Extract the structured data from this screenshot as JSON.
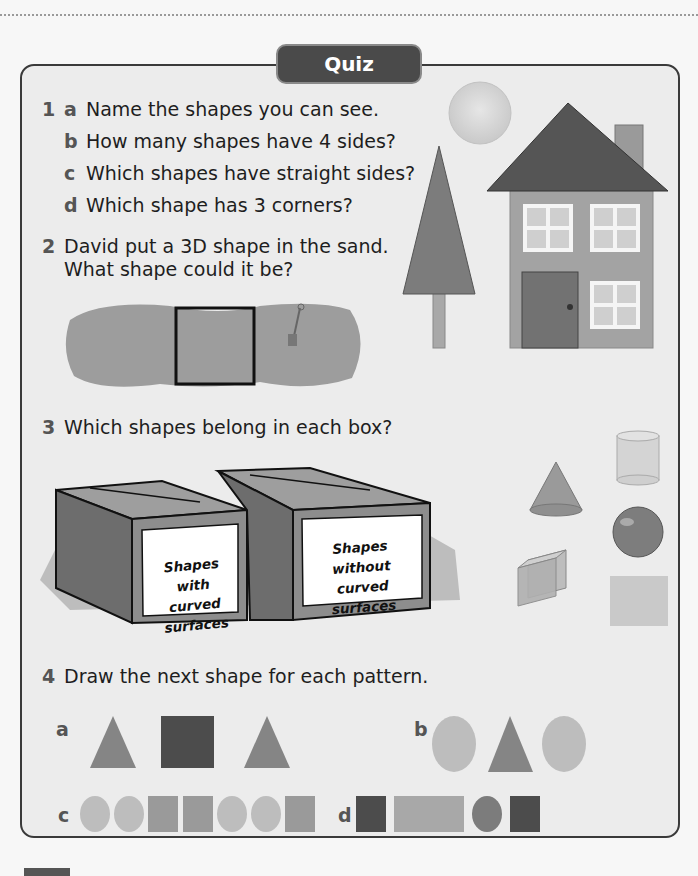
{
  "header": {
    "tab_label": "Quiz"
  },
  "questions": [
    {
      "number": "1",
      "parts": [
        {
          "letter": "a",
          "text": "Name the shapes you can see."
        },
        {
          "letter": "b",
          "text": "How many shapes have 4 sides?"
        },
        {
          "letter": "c",
          "text": "Which shapes have straight sides?"
        },
        {
          "letter": "d",
          "text": "Which shape has 3 corners?"
        }
      ]
    },
    {
      "number": "2",
      "lines": [
        "David put a 3D shape in the sand.",
        "What shape could it be?"
      ]
    },
    {
      "number": "3",
      "text": "Which shapes belong in each box?",
      "boxes": [
        {
          "line1": "Shapes with",
          "line2": "curved surfaces"
        },
        {
          "line1": "Shapes without",
          "line2": "curved surfaces"
        }
      ],
      "shapes": [
        "cone",
        "cylinder",
        "sphere",
        "cube",
        "square-prism"
      ]
    },
    {
      "number": "4",
      "text": "Draw the next shape for each pattern.",
      "patterns": [
        {
          "letter": "a",
          "sequence": [
            "triangle",
            "square",
            "triangle"
          ]
        },
        {
          "letter": "b",
          "sequence": [
            "circle",
            "triangle",
            "circle"
          ]
        },
        {
          "letter": "c",
          "sequence": [
            "circle",
            "circle",
            "square",
            "square",
            "circle",
            "circle",
            "square"
          ]
        },
        {
          "letter": "d",
          "sequence": [
            "square",
            "rectangle",
            "circle",
            "square"
          ]
        }
      ]
    }
  ],
  "illustration1": {
    "items": [
      "sun-circle",
      "tree-triangle",
      "house"
    ]
  },
  "colors": {
    "tab": "#4a4a4a",
    "panel": "#ececec",
    "border": "#3a3a3a"
  }
}
